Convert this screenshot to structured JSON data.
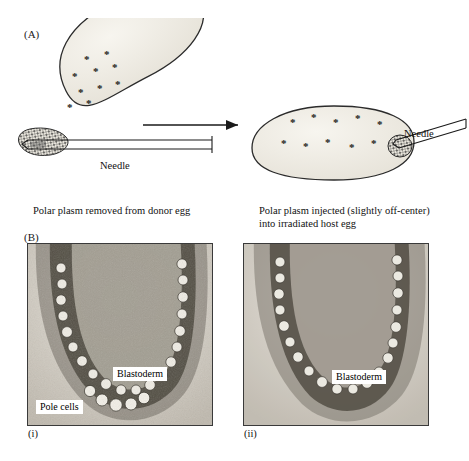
{
  "figure": {
    "panels": {
      "a": {
        "label": "(A)",
        "needle_label_left": "Needle",
        "needle_label_right": "Needle",
        "caption_left": "Polar plasm removed from donor egg",
        "caption_right": "Polar plasm injected (slightly off-center) into irradiated host egg",
        "donor_egg": {
          "name": "donor-egg",
          "polar_plasm_granule_count": 9
        },
        "host_egg": {
          "name": "irradiated-host-egg",
          "injected_granule_count": 9
        },
        "arrow": "right-arrow"
      },
      "b": {
        "label": "(B)",
        "micrographs": [
          {
            "sublabel": "(i)",
            "tags": [
              "Blastoderm",
              "Pole cells"
            ]
          },
          {
            "sublabel": "(ii)",
            "tags": [
              "Blastoderm"
            ]
          }
        ]
      }
    }
  },
  "colors": {
    "ink": "#000000",
    "egg_fill": "#efece4",
    "egg_outline": "#2b2b2b",
    "micrograph_border": "#3a3a3a",
    "tag_background": "#ffffff"
  }
}
